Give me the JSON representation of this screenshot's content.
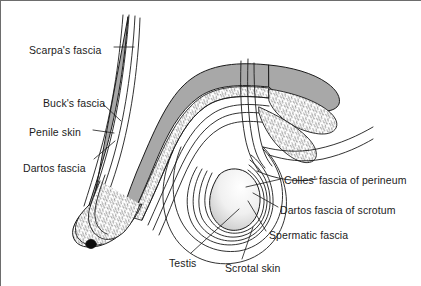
{
  "figure": {
    "background_color": "#ffffff",
    "line_color": "#1b1b1b",
    "shaft_fill": "#a8a8a8",
    "stipple_fill": "#ffffff",
    "testis_fill": "#f2f2f2"
  },
  "labels": [
    {
      "id": "scarpas-fascia",
      "text": "Scarpa's fascia",
      "x": 28,
      "y": 44
    },
    {
      "id": "bucks-fascia",
      "text": "Buck's fascia",
      "x": 42,
      "y": 97
    },
    {
      "id": "penile-skin",
      "text": "Penile skin",
      "x": 28,
      "y": 126
    },
    {
      "id": "dartos-fascia",
      "text": "Dartos fascia",
      "x": 22,
      "y": 162
    },
    {
      "id": "colles-fascia-of-perineum",
      "text": "Colles' fascia of perineum",
      "x": 283,
      "y": 174
    },
    {
      "id": "dartos-fascia-of-scrotum",
      "text": "Dartos fascia of scrotum",
      "x": 279,
      "y": 204
    },
    {
      "id": "spermatic-fascia",
      "text": "Spermatic fascia",
      "x": 268,
      "y": 229
    },
    {
      "id": "testis",
      "text": "Testis",
      "x": 168,
      "y": 257
    },
    {
      "id": "scrotal-skin",
      "text": "Scrotal skin",
      "x": 224,
      "y": 262
    }
  ],
  "structures": [
    {
      "id": "penile-shaft",
      "name": "penile shaft corpus"
    },
    {
      "id": "glans-penis",
      "name": "glans penis"
    },
    {
      "id": "urethral-meatus",
      "name": "urethral meatus"
    },
    {
      "id": "scrotal-sac",
      "name": "scrotal sac"
    },
    {
      "id": "testis-body",
      "name": "testis body"
    },
    {
      "id": "perineal-fascia",
      "name": "perineal fascia flap"
    }
  ]
}
